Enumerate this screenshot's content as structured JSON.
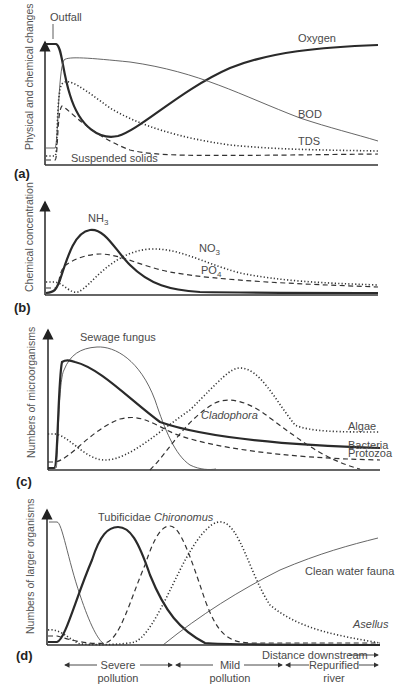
{
  "figure": {
    "x_axis_label": "Distance downstream",
    "zones": [
      {
        "label_line1": "Severe",
        "label_line2": "pollution"
      },
      {
        "label_line1": "Mild",
        "label_line2": "pollution"
      },
      {
        "label_line1": "Repurified",
        "label_line2": "river"
      }
    ],
    "outfall_label": "Outfall"
  },
  "panels": [
    {
      "id": "a",
      "panel_label": "(a)",
      "ylabel": "Physical and chemical changes",
      "curves": [
        {
          "name": "Oxygen",
          "style": "thick"
        },
        {
          "name": "BOD",
          "style": "thin"
        },
        {
          "name": "TDS",
          "style": "dotted"
        },
        {
          "name": "Suspended solids",
          "style": "dashed"
        }
      ]
    },
    {
      "id": "b",
      "panel_label": "(b)",
      "ylabel": "Chemical concentration",
      "curves": [
        {
          "name": "NH",
          "sub": "3",
          "style": "thick"
        },
        {
          "name": "NO",
          "sub": "3",
          "style": "dotted"
        },
        {
          "name": "PO",
          "sub": "4",
          "style": "dashed"
        }
      ]
    },
    {
      "id": "c",
      "panel_label": "(c)",
      "ylabel": "Numbers of microorganisms",
      "curves": [
        {
          "name": "Sewage fungus",
          "style": "thin"
        },
        {
          "name": "Bacteria",
          "style": "thick"
        },
        {
          "name": "Algae",
          "style": "dotted"
        },
        {
          "name": "Cladophora",
          "style": "dashed",
          "italic": true
        },
        {
          "name": "Protozoa",
          "style": "dashed"
        }
      ]
    },
    {
      "id": "d",
      "panel_label": "(d)",
      "ylabel": "Numbers of larger organisms",
      "curves": [
        {
          "name": "Tubificidae",
          "style": "thick"
        },
        {
          "name": "Chironomus",
          "style": "dashed",
          "italic": true
        },
        {
          "name": "Asellus",
          "style": "dotted",
          "italic": true
        },
        {
          "name": "Clean water fauna",
          "style": "thin"
        }
      ]
    }
  ]
}
